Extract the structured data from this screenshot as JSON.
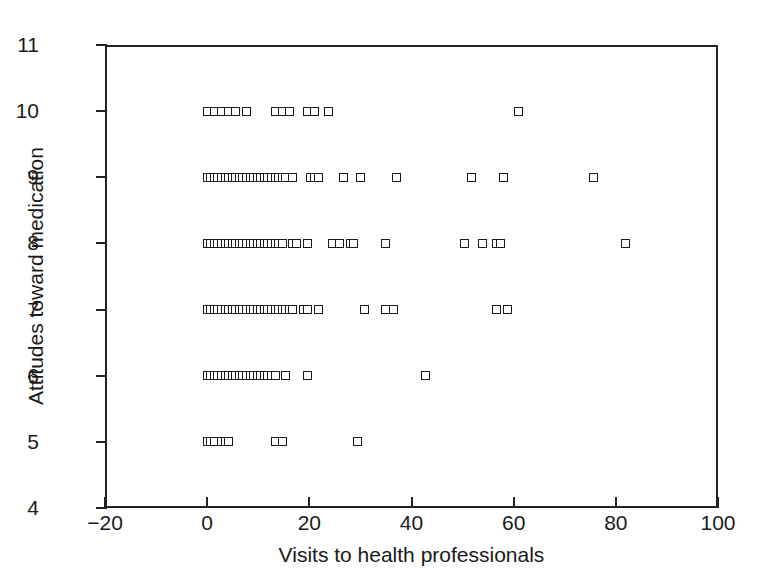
{
  "chart_data": {
    "type": "scatter",
    "title": "",
    "xlabel": "Visits to health professionals",
    "ylabel": "Attitudes toward medication",
    "xlim": [
      -20,
      100
    ],
    "ylim": [
      4,
      11
    ],
    "xticks": [
      -20,
      0,
      20,
      40,
      60,
      80,
      100
    ],
    "xtick_labels": [
      "−20",
      "0",
      "20",
      "40",
      "60",
      "80",
      "100"
    ],
    "yticks": [
      4,
      5,
      6,
      7,
      8,
      9,
      10,
      11
    ],
    "ytick_labels": [
      "4",
      "5",
      "6",
      "7",
      "8",
      "9",
      "10",
      "11"
    ],
    "grid": false,
    "legend": null,
    "marker": "open-square",
    "series": [
      {
        "name": "respondents",
        "points": [
          [
            0,
            10
          ],
          [
            1.4,
            10
          ],
          [
            2.8,
            10
          ],
          [
            4.2,
            10
          ],
          [
            5.6,
            10
          ],
          [
            7.7,
            10
          ],
          [
            13.3,
            10
          ],
          [
            14.7,
            10
          ],
          [
            16.1,
            10
          ],
          [
            19.6,
            10
          ],
          [
            21.0,
            10
          ],
          [
            23.8,
            10
          ],
          [
            60.9,
            10
          ],
          [
            0,
            9
          ],
          [
            0.7,
            9
          ],
          [
            1.4,
            9
          ],
          [
            2.1,
            9
          ],
          [
            2.8,
            9
          ],
          [
            3.5,
            9
          ],
          [
            4.2,
            9
          ],
          [
            4.9,
            9
          ],
          [
            5.6,
            9
          ],
          [
            6.3,
            9
          ],
          [
            7.0,
            9
          ],
          [
            7.7,
            9
          ],
          [
            8.4,
            9
          ],
          [
            9.1,
            9
          ],
          [
            9.8,
            9
          ],
          [
            10.5,
            9
          ],
          [
            11.2,
            9
          ],
          [
            11.9,
            9
          ],
          [
            12.6,
            9
          ],
          [
            13.3,
            9
          ],
          [
            14.0,
            9
          ],
          [
            14.7,
            9
          ],
          [
            15.4,
            9
          ],
          [
            16.8,
            9
          ],
          [
            20.3,
            9
          ],
          [
            21.0,
            9
          ],
          [
            21.7,
            9
          ],
          [
            26.6,
            9
          ],
          [
            30.1,
            9
          ],
          [
            37.1,
            9
          ],
          [
            51.8,
            9
          ],
          [
            58.1,
            9
          ],
          [
            75.6,
            9
          ],
          [
            0,
            8
          ],
          [
            0.7,
            8
          ],
          [
            1.4,
            8
          ],
          [
            2.1,
            8
          ],
          [
            2.8,
            8
          ],
          [
            3.5,
            8
          ],
          [
            4.2,
            8
          ],
          [
            4.9,
            8
          ],
          [
            5.6,
            8
          ],
          [
            6.3,
            8
          ],
          [
            7.0,
            8
          ],
          [
            7.7,
            8
          ],
          [
            8.4,
            8
          ],
          [
            9.1,
            8
          ],
          [
            9.8,
            8
          ],
          [
            10.5,
            8
          ],
          [
            11.2,
            8
          ],
          [
            11.9,
            8
          ],
          [
            12.6,
            8
          ],
          [
            13.3,
            8
          ],
          [
            14.0,
            8
          ],
          [
            14.7,
            8
          ],
          [
            16.8,
            8
          ],
          [
            17.5,
            8
          ],
          [
            19.6,
            8
          ],
          [
            24.5,
            8
          ],
          [
            25.9,
            8
          ],
          [
            28.0,
            8
          ],
          [
            28.7,
            8
          ],
          [
            35.0,
            8
          ],
          [
            50.4,
            8
          ],
          [
            53.9,
            8
          ],
          [
            56.7,
            8
          ],
          [
            57.4,
            8
          ],
          [
            81.9,
            8
          ],
          [
            0,
            7
          ],
          [
            0.7,
            7
          ],
          [
            1.4,
            7
          ],
          [
            2.1,
            7
          ],
          [
            2.8,
            7
          ],
          [
            3.5,
            7
          ],
          [
            4.2,
            7
          ],
          [
            4.9,
            7
          ],
          [
            5.6,
            7
          ],
          [
            6.3,
            7
          ],
          [
            7.0,
            7
          ],
          [
            7.7,
            7
          ],
          [
            8.4,
            7
          ],
          [
            9.1,
            7
          ],
          [
            9.8,
            7
          ],
          [
            10.5,
            7
          ],
          [
            11.2,
            7
          ],
          [
            11.9,
            7
          ],
          [
            12.6,
            7
          ],
          [
            13.3,
            7
          ],
          [
            14.0,
            7
          ],
          [
            14.7,
            7
          ],
          [
            15.4,
            7
          ],
          [
            16.1,
            7
          ],
          [
            16.8,
            7
          ],
          [
            18.9,
            7
          ],
          [
            19.6,
            7
          ],
          [
            21.7,
            7
          ],
          [
            30.8,
            7
          ],
          [
            35.0,
            7
          ],
          [
            36.4,
            7
          ],
          [
            56.7,
            7
          ],
          [
            58.8,
            7
          ],
          [
            0,
            6
          ],
          [
            0.7,
            6
          ],
          [
            1.4,
            6
          ],
          [
            2.1,
            6
          ],
          [
            2.8,
            6
          ],
          [
            3.5,
            6
          ],
          [
            4.2,
            6
          ],
          [
            4.9,
            6
          ],
          [
            5.6,
            6
          ],
          [
            6.3,
            6
          ],
          [
            7.0,
            6
          ],
          [
            7.7,
            6
          ],
          [
            8.4,
            6
          ],
          [
            9.1,
            6
          ],
          [
            9.8,
            6
          ],
          [
            10.5,
            6
          ],
          [
            11.2,
            6
          ],
          [
            11.9,
            6
          ],
          [
            12.6,
            6
          ],
          [
            13.3,
            6
          ],
          [
            15.4,
            6
          ],
          [
            19.6,
            6
          ],
          [
            42.7,
            6
          ],
          [
            0,
            5
          ],
          [
            0.7,
            5
          ],
          [
            1.4,
            5
          ],
          [
            2.8,
            5
          ],
          [
            3.5,
            5
          ],
          [
            4.2,
            5
          ],
          [
            13.3,
            5
          ],
          [
            14.7,
            5
          ],
          [
            29.4,
            5
          ]
        ]
      }
    ]
  },
  "figure": {
    "axis_color": "#232323",
    "marker_color": "#1a1a1a",
    "background": "#ffffff"
  }
}
